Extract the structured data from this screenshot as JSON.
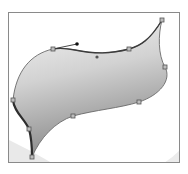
{
  "figure": {
    "frame": {
      "x": 8,
      "y": 12,
      "width": 172,
      "height": 151,
      "stroke": "#8a8a8a"
    },
    "colors": {
      "background": "#ffffff",
      "fill_top": "#f2f2f2",
      "fill_bottom": "#8e8e8e",
      "path_stroke": "#6a6a6a",
      "highlight_stroke": "#3c3c3c",
      "anchor_fill": "#b8b8b8",
      "anchor_stroke": "#555555",
      "handle_point": "#111111",
      "ghost_arc": "#e6e6e6"
    },
    "anchor_points": [
      {
        "id": "top-left-anchor",
        "x": 53,
        "y": 49
      },
      {
        "id": "top-mid-anchor",
        "x": 129,
        "y": 49
      },
      {
        "id": "top-right-tip-anchor",
        "x": 162,
        "y": 20
      },
      {
        "id": "right-anchor",
        "x": 165,
        "y": 67
      },
      {
        "id": "bottom-right-anchor",
        "x": 139,
        "y": 102
      },
      {
        "id": "bottom-mid-anchor",
        "x": 73,
        "y": 116
      },
      {
        "id": "left-anchor",
        "x": 13,
        "y": 100
      },
      {
        "id": "lower-left-anchor",
        "x": 29,
        "y": 129
      },
      {
        "id": "bottom-tip-anchor",
        "x": 32,
        "y": 157
      }
    ],
    "direction_handles": [
      {
        "id": "selected-handle",
        "from": {
          "x": 53,
          "y": 49
        },
        "to": {
          "x": 77,
          "y": 44
        }
      },
      {
        "id": "opposite-handle-point",
        "x": 97,
        "y": 57
      }
    ]
  }
}
